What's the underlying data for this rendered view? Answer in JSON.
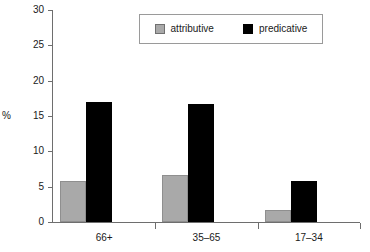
{
  "chart_data": {
    "type": "bar",
    "title": "",
    "xlabel": "",
    "ylabel": "%",
    "categories": [
      "66+",
      "35–65",
      "17–34"
    ],
    "series": [
      {
        "name": "attributive",
        "color": "#a9a9a9",
        "values": [
          5.8,
          6.6,
          1.7
        ]
      },
      {
        "name": "predicative",
        "color": "#000000",
        "values": [
          17.0,
          16.7,
          5.8
        ]
      }
    ],
    "ylim": [
      0,
      30
    ],
    "ytick_step": 5,
    "yticks": [
      0,
      5,
      10,
      15,
      20,
      25,
      30
    ],
    "ytick_labels": [
      "0",
      "5",
      "10",
      "15",
      "20",
      "25",
      "30"
    ],
    "grid": false,
    "legend_position": "top-right-inside",
    "legend_boxed": true
  }
}
